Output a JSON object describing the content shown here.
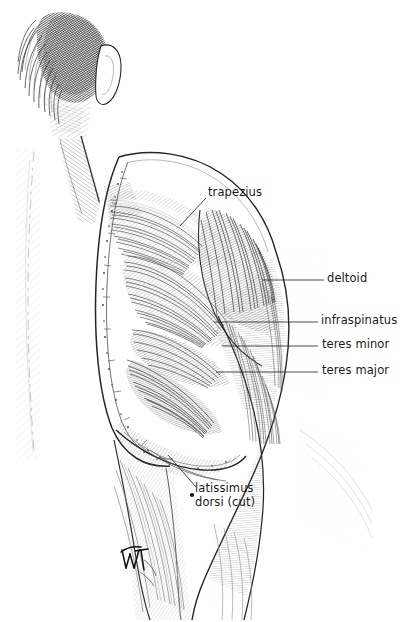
{
  "figure": {
    "medium": "pen-and-ink anatomical illustration",
    "background_color": "#ffffff",
    "ink_color": "#1a1a1a",
    "width": 407,
    "height": 622
  },
  "labels": {
    "trapezius": "trapezius",
    "deltoid": "deltoid",
    "infraspinatus": "infraspinatus",
    "teres_minor": "teres minor",
    "teres_major": "teres major",
    "latissimus_line1": "latissimus",
    "latissimus_line2": "dorsi (cut)"
  },
  "signature": {
    "monogram": "WT"
  }
}
